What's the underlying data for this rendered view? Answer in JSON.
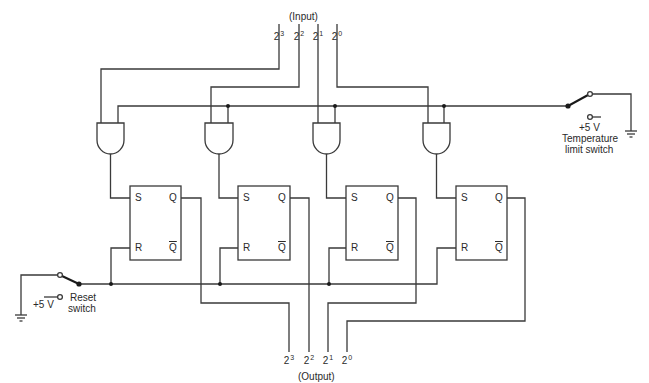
{
  "diagram": {
    "type": "logic-circuit",
    "input_label": "(Input)",
    "output_label": "(Output)",
    "input_bits": [
      {
        "base": "2",
        "exp": "3"
      },
      {
        "base": "2",
        "exp": "2"
      },
      {
        "base": "2",
        "exp": "1"
      },
      {
        "base": "2",
        "exp": "0"
      }
    ],
    "output_bits": [
      {
        "base": "2",
        "exp": "3"
      },
      {
        "base": "2",
        "exp": "2"
      },
      {
        "base": "2",
        "exp": "1"
      },
      {
        "base": "2",
        "exp": "0"
      }
    ],
    "flip_flops": [
      {
        "set": "S",
        "reset": "R",
        "q": "Q",
        "qbar": "Q"
      },
      {
        "set": "S",
        "reset": "R",
        "q": "Q",
        "qbar": "Q"
      },
      {
        "set": "S",
        "reset": "R",
        "q": "Q",
        "qbar": "Q"
      },
      {
        "set": "S",
        "reset": "R",
        "q": "Q",
        "qbar": "Q"
      }
    ],
    "gates": [
      "AND",
      "AND",
      "AND",
      "AND"
    ],
    "temperature_switch": {
      "voltage": "+5 V",
      "label_line1": "Temperature",
      "label_line2": "limit switch"
    },
    "reset_switch": {
      "voltage": "+5 V",
      "label_line1": "Reset",
      "label_line2": "switch"
    }
  }
}
